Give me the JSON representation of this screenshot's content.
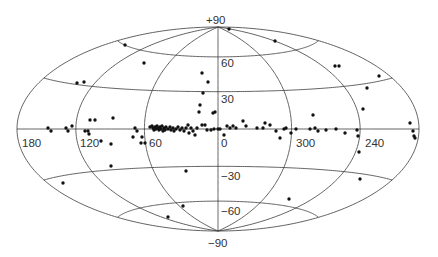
{
  "chart_data": {
    "type": "scatter",
    "projection": "hammer-aitoff (galactic coordinates)",
    "title": "",
    "xlabel": "galactic longitude (deg)",
    "ylabel": "galactic latitude (deg)",
    "grid": true,
    "legend": null,
    "geometry": {
      "cx": 218,
      "cy": 129,
      "a": 201,
      "b": 102
    },
    "longitude_labels": [
      {
        "text": "180",
        "x": 22,
        "y": 147
      },
      {
        "text": "120",
        "x": 80,
        "y": 147
      },
      {
        "text": "60",
        "x": 149,
        "y": 147
      },
      {
        "text": "0",
        "x": 221,
        "y": 147
      },
      {
        "text": "300",
        "x": 296,
        "y": 147
      },
      {
        "text": "240",
        "x": 365,
        "y": 147
      }
    ],
    "latitude_labels": [
      {
        "text": "+90",
        "x": 206,
        "y": 24
      },
      {
        "text": "60",
        "x": 221,
        "y": 67
      },
      {
        "text": "30",
        "x": 221,
        "y": 103
      },
      {
        "text": "−30",
        "x": 221,
        "y": 180
      },
      {
        "text": "−60",
        "x": 221,
        "y": 215
      },
      {
        "text": "−90",
        "x": 208,
        "y": 247
      }
    ],
    "grid_longitudes": [
      0,
      60,
      120,
      180,
      240,
      300
    ],
    "grid_latitudes": [
      -60,
      -30,
      0,
      30,
      60
    ],
    "points_px": [
      [
        125,
        45
      ],
      [
        144,
        63
      ],
      [
        77,
        83
      ],
      [
        84,
        82
      ],
      [
        113,
        118
      ],
      [
        202,
        73
      ],
      [
        208,
        82
      ],
      [
        203,
        93
      ],
      [
        200,
        105
      ],
      [
        213,
        113
      ],
      [
        215,
        112
      ],
      [
        229,
        29
      ],
      [
        275,
        41
      ],
      [
        335,
        66
      ],
      [
        339,
        66
      ],
      [
        379,
        76
      ],
      [
        367,
        88
      ],
      [
        363,
        109
      ],
      [
        313,
        115
      ],
      [
        410,
        123
      ],
      [
        90,
        120
      ],
      [
        95,
        120
      ],
      [
        48,
        128
      ],
      [
        51,
        131
      ],
      [
        66,
        128
      ],
      [
        68,
        131
      ],
      [
        72,
        126
      ],
      [
        85,
        131
      ],
      [
        88,
        131
      ],
      [
        89,
        134
      ],
      [
        101,
        141
      ],
      [
        111,
        144
      ],
      [
        111,
        166
      ],
      [
        135,
        128
      ],
      [
        137,
        131
      ],
      [
        133,
        137
      ],
      [
        142,
        137
      ],
      [
        141,
        143
      ],
      [
        145,
        143
      ],
      [
        150,
        127
      ],
      [
        152,
        126
      ],
      [
        153,
        128
      ],
      [
        154,
        130
      ],
      [
        155,
        127
      ],
      [
        156,
        129
      ],
      [
        157,
        126
      ],
      [
        158,
        128
      ],
      [
        159,
        130
      ],
      [
        160,
        127
      ],
      [
        161,
        129
      ],
      [
        162,
        126
      ],
      [
        163,
        131
      ],
      [
        164,
        128
      ],
      [
        165,
        130
      ],
      [
        166,
        127
      ],
      [
        168,
        129
      ],
      [
        170,
        127
      ],
      [
        171,
        130
      ],
      [
        173,
        128
      ],
      [
        174,
        131
      ],
      [
        176,
        129
      ],
      [
        178,
        127
      ],
      [
        180,
        130
      ],
      [
        182,
        128
      ],
      [
        184,
        131
      ],
      [
        186,
        128
      ],
      [
        188,
        125
      ],
      [
        189,
        133
      ],
      [
        191,
        128
      ],
      [
        193,
        131
      ],
      [
        195,
        135
      ],
      [
        197,
        128
      ],
      [
        199,
        112
      ],
      [
        202,
        125
      ],
      [
        205,
        125
      ],
      [
        207,
        130
      ],
      [
        211,
        130
      ],
      [
        214,
        129
      ],
      [
        218,
        129
      ],
      [
        220,
        129
      ],
      [
        224,
        135
      ],
      [
        227,
        126
      ],
      [
        230,
        128
      ],
      [
        233,
        126
      ],
      [
        236,
        128
      ],
      [
        243,
        121
      ],
      [
        246,
        126
      ],
      [
        257,
        128
      ],
      [
        263,
        128
      ],
      [
        265,
        123
      ],
      [
        270,
        125
      ],
      [
        276,
        131
      ],
      [
        280,
        138
      ],
      [
        284,
        129
      ],
      [
        286,
        128
      ],
      [
        291,
        133
      ],
      [
        296,
        129
      ],
      [
        310,
        129
      ],
      [
        315,
        128
      ],
      [
        318,
        131
      ],
      [
        326,
        130
      ],
      [
        336,
        129
      ],
      [
        345,
        133
      ],
      [
        357,
        130
      ],
      [
        358,
        136
      ],
      [
        359,
        152
      ],
      [
        413,
        131
      ],
      [
        414,
        136
      ],
      [
        415,
        138
      ],
      [
        63,
        183
      ],
      [
        186,
        171
      ],
      [
        183,
        206
      ],
      [
        168,
        217
      ],
      [
        289,
        199
      ],
      [
        360,
        179
      ]
    ]
  }
}
